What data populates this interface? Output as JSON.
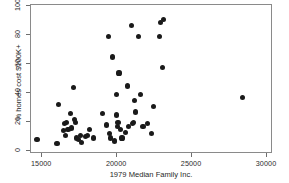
{
  "chart_data": {
    "type": "scatter",
    "title": "",
    "xlabel": "1979 Median Family Inc.",
    "ylabel": "% homes cost $100K+",
    "xlim": [
      14250,
      30400
    ],
    "ylim": [
      -2,
      101
    ],
    "xticks": [
      15000,
      20000,
      25000,
      30000
    ],
    "xticklabels": [
      "15000",
      "20000",
      "25000",
      "30000"
    ],
    "yticks": [
      0,
      20,
      40,
      60,
      80,
      100
    ],
    "yticklabels": [
      "0",
      "20",
      "40",
      "60",
      "80",
      "100"
    ],
    "grid": false,
    "legend": false,
    "marker": "filled-circle",
    "marker_color": "#1a1a1a",
    "frame_color": "#8a8a8a",
    "points": [
      {
        "x": 14650,
        "y": 8
      },
      {
        "x": 15980,
        "y": 5
      },
      {
        "x": 16080,
        "y": 32
      },
      {
        "x": 16430,
        "y": 14
      },
      {
        "x": 16480,
        "y": 19
      },
      {
        "x": 16560,
        "y": 11
      },
      {
        "x": 16620,
        "y": 20
      },
      {
        "x": 16720,
        "y": 15
      },
      {
        "x": 16880,
        "y": 26
      },
      {
        "x": 16960,
        "y": 16
      },
      {
        "x": 17080,
        "y": 44
      },
      {
        "x": 17150,
        "y": 22
      },
      {
        "x": 17200,
        "y": 20
      },
      {
        "x": 17270,
        "y": 9
      },
      {
        "x": 17400,
        "y": 8
      },
      {
        "x": 17540,
        "y": 11
      },
      {
        "x": 17640,
        "y": 6
      },
      {
        "x": 17900,
        "y": 10
      },
      {
        "x": 18000,
        "y": 11
      },
      {
        "x": 18180,
        "y": 15
      },
      {
        "x": 18400,
        "y": 9
      },
      {
        "x": 19000,
        "y": 26
      },
      {
        "x": 19280,
        "y": 18
      },
      {
        "x": 19420,
        "y": 79
      },
      {
        "x": 19500,
        "y": 12
      },
      {
        "x": 19580,
        "y": 9
      },
      {
        "x": 19700,
        "y": 65
      },
      {
        "x": 19820,
        "y": 7
      },
      {
        "x": 19950,
        "y": 25
      },
      {
        "x": 19980,
        "y": 39
      },
      {
        "x": 20000,
        "y": 17
      },
      {
        "x": 20050,
        "y": 20
      },
      {
        "x": 20120,
        "y": 54
      },
      {
        "x": 20200,
        "y": 15
      },
      {
        "x": 20320,
        "y": 9
      },
      {
        "x": 20560,
        "y": 13
      },
      {
        "x": 20680,
        "y": 45
      },
      {
        "x": 20780,
        "y": 17
      },
      {
        "x": 20980,
        "y": 87
      },
      {
        "x": 21020,
        "y": 19
      },
      {
        "x": 21100,
        "y": 20
      },
      {
        "x": 21180,
        "y": 35
      },
      {
        "x": 21250,
        "y": 27
      },
      {
        "x": 21450,
        "y": 79
      },
      {
        "x": 21560,
        "y": 39
      },
      {
        "x": 21720,
        "y": 17
      },
      {
        "x": 22050,
        "y": 19
      },
      {
        "x": 22300,
        "y": 12
      },
      {
        "x": 22450,
        "y": 31
      },
      {
        "x": 22820,
        "y": 79
      },
      {
        "x": 22900,
        "y": 89
      },
      {
        "x": 23100,
        "y": 91
      },
      {
        "x": 23050,
        "y": 58
      },
      {
        "x": 28350,
        "y": 37
      }
    ]
  }
}
